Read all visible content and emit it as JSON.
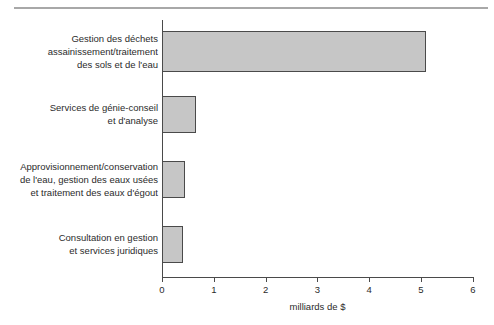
{
  "chart_data": {
    "type": "bar",
    "orientation": "horizontal",
    "title": "",
    "subtitle": "",
    "xlabel": "milliards de $",
    "ylabel": "",
    "xlim": [
      0,
      6
    ],
    "xticks": [
      0,
      1,
      2,
      3,
      4,
      5,
      6
    ],
    "xtick_labels": [
      "0",
      "1",
      "2",
      "3",
      "4",
      "5",
      "6"
    ],
    "grid": false,
    "legend": null,
    "bar_fill_color": "#c6c6c6",
    "bar_edge_color": "#4a4a4a",
    "axis_color": "#4a4a4a",
    "categories": [
      "Gestion des déchets\nassainissement/traitement\ndes sols et de l'eau",
      "Services de génie-conseil\net d'analyse",
      "Approvisionnement/conservation\nde l'eau, gestion des eaux usées\net traitement des eaux d'égout",
      "Consultation en gestion\net services juridiques"
    ],
    "values": [
      5.1,
      0.65,
      0.45,
      0.4
    ]
  },
  "decorations": {
    "top_rule_color": "#a8a8a8"
  }
}
